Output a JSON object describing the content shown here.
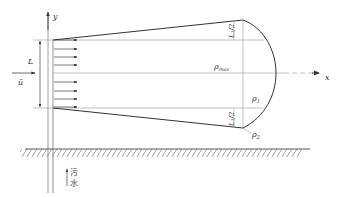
{
  "diagram": {
    "type": "plume-cross-section",
    "labels": {
      "y_axis": "y",
      "x_axis": "x",
      "velocity": "ū",
      "width": "L",
      "rho_max": "ρ",
      "rho_max_sub": "max",
      "rho1": "ρ",
      "rho1_sub": "1",
      "rho2": "ρ",
      "rho2_sub": "2",
      "half_width_top": "L₁/2",
      "half_width_bottom": "L₁/2",
      "inflow_char1": "污",
      "inflow_char2": "水"
    },
    "colors": {
      "line": "#444444",
      "thin_line": "#8a8a8a",
      "text": "#333333"
    },
    "velocity_arrow_count": 8
  }
}
